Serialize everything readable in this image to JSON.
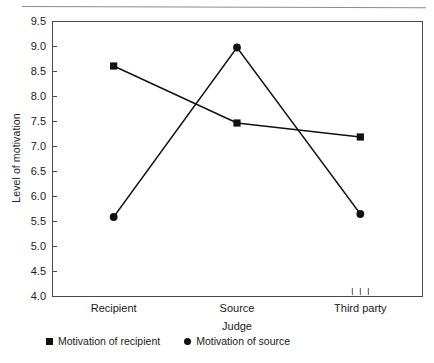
{
  "chart_data": {
    "type": "line",
    "title": "",
    "xlabel": "Judge",
    "ylabel": "Level of motivation",
    "categories": [
      "Recipient",
      "Source",
      "Third party"
    ],
    "ylim": [
      4.0,
      9.5
    ],
    "ytick_labels": [
      "9.5",
      "9.0",
      "8.5",
      "8.0",
      "7.5",
      "7.0",
      "6.5",
      "6.0",
      "5.5",
      "5.0",
      "4.5",
      "4.0"
    ],
    "ytick_values": [
      9.5,
      9.0,
      8.5,
      8.0,
      7.5,
      7.0,
      6.5,
      6.0,
      5.5,
      5.0,
      4.5,
      4.0
    ],
    "grid": false,
    "legend_position": "bottom",
    "series": [
      {
        "name": "Motivation of recipient",
        "marker": "square",
        "color": "#111111",
        "values": [
          8.6,
          7.46,
          7.18
        ]
      },
      {
        "name": "Motivation of source",
        "marker": "circle",
        "color": "#111111",
        "values": [
          5.58,
          8.97,
          5.64
        ]
      }
    ]
  },
  "axes": {
    "y_axis_title": "Level of motivation",
    "x_axis_title": "Judge"
  },
  "legend": {
    "items": [
      {
        "label": "Motivation of recipient",
        "marker": "square-marker-icon"
      },
      {
        "label": "Motivation of source",
        "marker": "circle-marker-icon"
      }
    ]
  },
  "colors": {
    "line": "#111111",
    "axis": "#4a4a4a",
    "rule": "#8c8c8c",
    "background": "#ffffff"
  }
}
